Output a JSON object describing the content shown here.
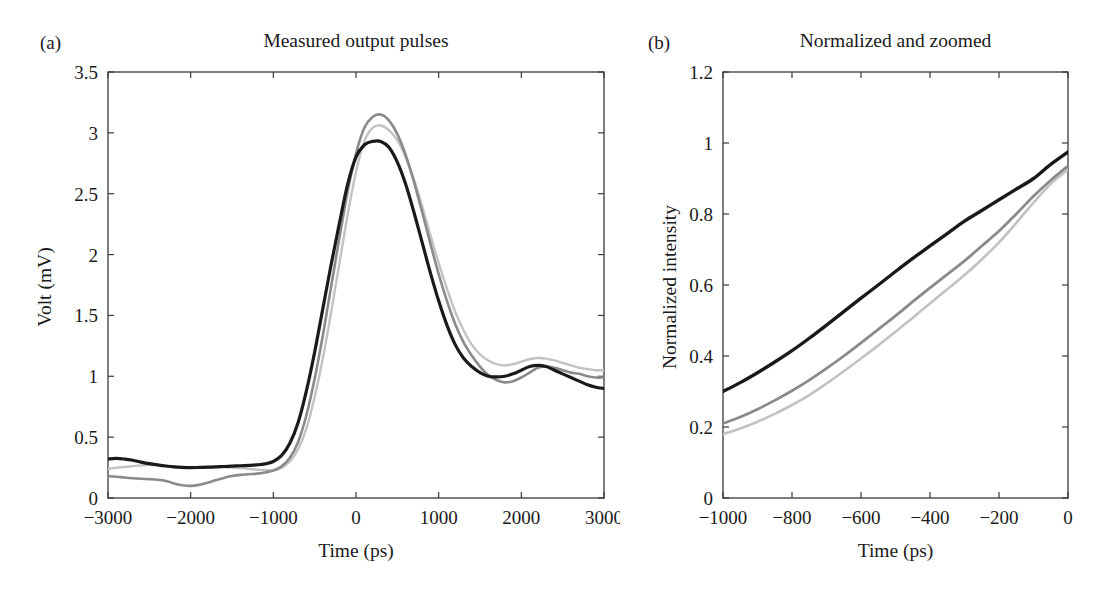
{
  "figure": {
    "background": "#ffffff",
    "axis_color": "#3a3a3a"
  },
  "panels": [
    {
      "letter": "(a)",
      "title": "Measured output pulses",
      "xlabel": "Time (ps)",
      "ylabel": "Volt (mV)"
    },
    {
      "letter": "(b)",
      "title": "Normalized and zoomed",
      "xlabel": "Time (ps)",
      "ylabel": "Normalized intensity"
    }
  ],
  "chart_data": [
    {
      "type": "line",
      "title": "Measured output pulses",
      "panel": "(a)",
      "xlabel": "Time (ps)",
      "ylabel": "Volt (mV)",
      "xlim": [
        -3000,
        3000
      ],
      "ylim": [
        0,
        3.5
      ],
      "xticks": [
        -3000,
        -2000,
        -1000,
        0,
        1000,
        2000,
        3000
      ],
      "xticklabels": [
        "−3000",
        "−2000",
        "−1000",
        "0",
        "1000",
        "2000",
        "3000"
      ],
      "yticks": [
        0,
        0.5,
        1,
        1.5,
        2,
        2.5,
        3,
        3.5
      ],
      "yticklabels": [
        "0",
        "0.5",
        "1",
        "1.5",
        "2",
        "2.5",
        "3",
        "3.5"
      ],
      "grid": false,
      "legend": "none",
      "series": [
        {
          "name": "curve-black",
          "color": "#1a1a1a",
          "width": 3.2,
          "x": [
            -3000,
            -2900,
            -2800,
            -2700,
            -2600,
            -2500,
            -2400,
            -2300,
            -2200,
            -2100,
            -2000,
            -1900,
            -1800,
            -1700,
            -1600,
            -1500,
            -1400,
            -1300,
            -1200,
            -1100,
            -1000,
            -900,
            -800,
            -700,
            -600,
            -500,
            -400,
            -300,
            -200,
            -100,
            0,
            100,
            200,
            300,
            400,
            500,
            600,
            700,
            800,
            900,
            1000,
            1100,
            1200,
            1300,
            1400,
            1500,
            1600,
            1700,
            1800,
            1900,
            2000,
            2100,
            2200,
            2300,
            2400,
            2500,
            2600,
            2700,
            2800,
            2900,
            3000
          ],
          "y": [
            0.32,
            0.325,
            0.32,
            0.31,
            0.295,
            0.282,
            0.272,
            0.263,
            0.256,
            0.252,
            0.25,
            0.251,
            0.253,
            0.256,
            0.259,
            0.262,
            0.265,
            0.268,
            0.272,
            0.28,
            0.3,
            0.35,
            0.45,
            0.62,
            0.88,
            1.2,
            1.56,
            1.92,
            2.26,
            2.58,
            2.8,
            2.9,
            2.93,
            2.93,
            2.88,
            2.76,
            2.58,
            2.35,
            2.1,
            1.85,
            1.62,
            1.42,
            1.26,
            1.15,
            1.08,
            1.03,
            1.0,
            0.995,
            1.0,
            1.02,
            1.05,
            1.08,
            1.09,
            1.08,
            1.05,
            1.02,
            0.99,
            0.96,
            0.93,
            0.91,
            0.9
          ]
        },
        {
          "name": "curve-gray",
          "color": "#8a8a8a",
          "width": 2.6,
          "x": [
            -3000,
            -2900,
            -2800,
            -2700,
            -2600,
            -2500,
            -2400,
            -2300,
            -2200,
            -2100,
            -2000,
            -1900,
            -1800,
            -1700,
            -1600,
            -1500,
            -1400,
            -1300,
            -1200,
            -1100,
            -1000,
            -900,
            -800,
            -700,
            -600,
            -500,
            -400,
            -300,
            -200,
            -100,
            0,
            100,
            200,
            300,
            400,
            500,
            600,
            700,
            800,
            900,
            1000,
            1100,
            1200,
            1300,
            1400,
            1500,
            1600,
            1700,
            1800,
            1900,
            2000,
            2100,
            2200,
            2300,
            2400,
            2500,
            2600,
            2700,
            2800,
            2900,
            3000
          ],
          "y": [
            0.18,
            0.175,
            0.168,
            0.162,
            0.158,
            0.155,
            0.15,
            0.14,
            0.12,
            0.105,
            0.1,
            0.108,
            0.125,
            0.145,
            0.165,
            0.18,
            0.19,
            0.195,
            0.2,
            0.21,
            0.225,
            0.26,
            0.33,
            0.46,
            0.68,
            0.98,
            1.34,
            1.74,
            2.14,
            2.52,
            2.83,
            3.04,
            3.13,
            3.15,
            3.1,
            2.99,
            2.82,
            2.6,
            2.35,
            2.09,
            1.84,
            1.62,
            1.43,
            1.28,
            1.17,
            1.08,
            1.01,
            0.97,
            0.95,
            0.96,
            0.99,
            1.03,
            1.07,
            1.08,
            1.07,
            1.05,
            1.03,
            1.02,
            1.0,
            0.99,
            0.99
          ]
        },
        {
          "name": "curve-lightgray",
          "color": "#c2c2c2",
          "width": 2.4,
          "x": [
            -3000,
            -2900,
            -2800,
            -2700,
            -2600,
            -2500,
            -2400,
            -2300,
            -2200,
            -2100,
            -2000,
            -1900,
            -1800,
            -1700,
            -1600,
            -1500,
            -1400,
            -1300,
            -1200,
            -1100,
            -1000,
            -900,
            -800,
            -700,
            -600,
            -500,
            -400,
            -300,
            -200,
            -100,
            0,
            100,
            200,
            300,
            400,
            500,
            600,
            700,
            800,
            900,
            1000,
            1100,
            1200,
            1300,
            1400,
            1500,
            1600,
            1700,
            1800,
            1900,
            2000,
            2100,
            2200,
            2300,
            2400,
            2500,
            2600,
            2700,
            2800,
            2900,
            3000
          ],
          "y": [
            0.24,
            0.248,
            0.255,
            0.262,
            0.268,
            0.27,
            0.268,
            0.262,
            0.255,
            0.25,
            0.248,
            0.248,
            0.25,
            0.252,
            0.252,
            0.25,
            0.246,
            0.24,
            0.232,
            0.228,
            0.23,
            0.25,
            0.3,
            0.4,
            0.57,
            0.83,
            1.15,
            1.53,
            1.93,
            2.33,
            2.68,
            2.93,
            3.04,
            3.06,
            3.02,
            2.94,
            2.8,
            2.62,
            2.4,
            2.16,
            1.93,
            1.72,
            1.53,
            1.38,
            1.26,
            1.18,
            1.13,
            1.1,
            1.09,
            1.1,
            1.12,
            1.14,
            1.15,
            1.145,
            1.13,
            1.11,
            1.09,
            1.07,
            1.06,
            1.05,
            1.05
          ]
        }
      ]
    },
    {
      "type": "line",
      "title": "Normalized and zoomed",
      "panel": "(b)",
      "xlabel": "Time (ps)",
      "ylabel": "Normalized intensity",
      "xlim": [
        -1000,
        0
      ],
      "ylim": [
        0,
        1.2
      ],
      "xticks": [
        -1000,
        -800,
        -600,
        -400,
        -200,
        0
      ],
      "xticklabels": [
        "−1000",
        "−800",
        "−600",
        "−400",
        "−200",
        "0"
      ],
      "yticks": [
        0,
        0.2,
        0.4,
        0.6,
        0.8,
        1,
        1.2
      ],
      "yticklabels": [
        "0",
        "0.2",
        "0.4",
        "0.6",
        "0.8",
        "1",
        "1.2"
      ],
      "grid": false,
      "legend": "none",
      "series": [
        {
          "name": "curve-black",
          "color": "#1a1a1a",
          "width": 3.4,
          "x": [
            -1000,
            -950,
            -900,
            -850,
            -800,
            -750,
            -700,
            -650,
            -600,
            -550,
            -500,
            -450,
            -400,
            -350,
            -300,
            -250,
            -200,
            -150,
            -100,
            -50,
            0
          ],
          "y": [
            0.3,
            0.325,
            0.353,
            0.383,
            0.415,
            0.45,
            0.487,
            0.525,
            0.563,
            0.6,
            0.638,
            0.675,
            0.71,
            0.745,
            0.78,
            0.81,
            0.84,
            0.87,
            0.9,
            0.94,
            0.975
          ]
        },
        {
          "name": "curve-gray",
          "color": "#8a8a8a",
          "width": 2.8,
          "x": [
            -1000,
            -950,
            -900,
            -850,
            -800,
            -750,
            -700,
            -650,
            -600,
            -550,
            -500,
            -450,
            -400,
            -350,
            -300,
            -250,
            -200,
            -150,
            -100,
            -50,
            0
          ],
          "y": [
            0.21,
            0.228,
            0.25,
            0.275,
            0.302,
            0.332,
            0.365,
            0.4,
            0.437,
            0.475,
            0.513,
            0.553,
            0.592,
            0.63,
            0.668,
            0.71,
            0.752,
            0.8,
            0.85,
            0.895,
            0.935
          ]
        },
        {
          "name": "curve-lightgray",
          "color": "#c2c2c2",
          "width": 2.6,
          "x": [
            -1000,
            -950,
            -900,
            -850,
            -800,
            -750,
            -700,
            -650,
            -600,
            -550,
            -500,
            -450,
            -400,
            -350,
            -300,
            -250,
            -200,
            -150,
            -100,
            -50,
            0
          ],
          "y": [
            0.18,
            0.196,
            0.215,
            0.237,
            0.262,
            0.29,
            0.322,
            0.357,
            0.393,
            0.43,
            0.468,
            0.508,
            0.548,
            0.588,
            0.628,
            0.672,
            0.72,
            0.775,
            0.832,
            0.885,
            0.925
          ]
        }
      ]
    }
  ]
}
